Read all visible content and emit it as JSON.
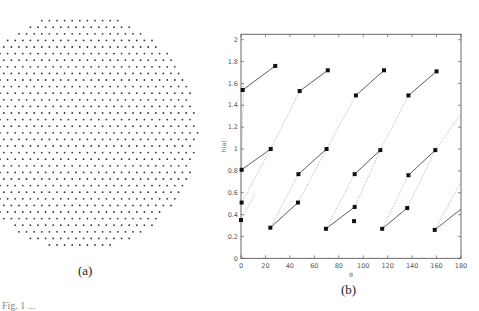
{
  "panels": {
    "a": {
      "caption": "(a)",
      "description": "hexagonal point lattice in circular region"
    },
    "b": {
      "caption": "(b)"
    }
  },
  "footer_cutoff_text": "Fig. 1 ...",
  "chart_data": {
    "type": "scatter",
    "title": "",
    "xlabel": "θ",
    "ylabel": "h(a)",
    "xlim": [
      0,
      180
    ],
    "ylim": [
      0,
      2.05
    ],
    "xticks": [
      0,
      20,
      40,
      60,
      80,
      100,
      120,
      140,
      160,
      180
    ],
    "yticks": [
      0,
      0.2,
      0.4,
      0.6,
      0.8,
      1,
      1.2,
      1.4,
      1.6,
      1.8,
      2
    ],
    "grid": false,
    "markers": [
      [
        0.5,
        0.81
      ],
      [
        24.3,
        1.0
      ],
      [
        0.5,
        0.51
      ],
      [
        0,
        0.35
      ],
      [
        24,
        0.28
      ],
      [
        47,
        0.77
      ],
      [
        46.6,
        0.51
      ],
      [
        70,
        1.0
      ],
      [
        69.5,
        0.27
      ],
      [
        93,
        0.77
      ],
      [
        93,
        0.47
      ],
      [
        92.5,
        0.34
      ],
      [
        114,
        0.99
      ],
      [
        115.5,
        0.27
      ],
      [
        137,
        0.76
      ],
      [
        136,
        0.46
      ],
      [
        159,
        0.99
      ],
      [
        158.5,
        0.26
      ],
      [
        1.4,
        1.54
      ],
      [
        28,
        1.76
      ],
      [
        48,
        1.53
      ],
      [
        71,
        1.72
      ],
      [
        94,
        1.49
      ],
      [
        117,
        1.72
      ],
      [
        137,
        1.49
      ],
      [
        160,
        1.71
      ]
    ],
    "solid_segments": [
      [
        [
          0.5,
          0.81
        ],
        [
          24.3,
          1.0
        ]
      ],
      [
        [
          1.4,
          1.54
        ],
        [
          28,
          1.76
        ]
      ],
      [
        [
          24,
          0.28
        ],
        [
          46.6,
          0.51
        ]
      ],
      [
        [
          47,
          0.77
        ],
        [
          70,
          1.0
        ]
      ],
      [
        [
          48,
          1.53
        ],
        [
          71,
          1.72
        ]
      ],
      [
        [
          69.5,
          0.27
        ],
        [
          93,
          0.47
        ]
      ],
      [
        [
          93,
          0.77
        ],
        [
          114,
          0.99
        ]
      ],
      [
        [
          94,
          1.49
        ],
        [
          117,
          1.72
        ]
      ],
      [
        [
          115.5,
          0.27
        ],
        [
          136,
          0.46
        ]
      ],
      [
        [
          137,
          0.76
        ],
        [
          159,
          0.99
        ]
      ],
      [
        [
          137,
          1.49
        ],
        [
          160,
          1.71
        ]
      ],
      [
        [
          158.5,
          0.26
        ],
        [
          180,
          0.45
        ]
      ]
    ],
    "dotted_segments": [
      [
        [
          0.5,
          0.51
        ],
        [
          24.3,
          1.0
        ]
      ],
      [
        [
          0,
          0.35
        ],
        [
          12,
          0.6
        ]
      ],
      [
        [
          0,
          0.6
        ],
        [
          2,
          1.6
        ]
      ],
      [
        [
          24.3,
          1.0
        ],
        [
          48,
          1.53
        ]
      ],
      [
        [
          24,
          0.28
        ],
        [
          47,
          0.77
        ]
      ],
      [
        [
          46.6,
          0.51
        ],
        [
          70,
          1.0
        ]
      ],
      [
        [
          70,
          1.0
        ],
        [
          94,
          1.49
        ]
      ],
      [
        [
          69.5,
          0.27
        ],
        [
          93,
          0.77
        ]
      ],
      [
        [
          93,
          0.47
        ],
        [
          114,
          0.99
        ]
      ],
      [
        [
          114,
          0.99
        ],
        [
          137,
          1.49
        ]
      ],
      [
        [
          115.5,
          0.27
        ],
        [
          137,
          0.76
        ]
      ],
      [
        [
          136,
          0.46
        ],
        [
          159,
          0.99
        ]
      ],
      [
        [
          159,
          0.99
        ],
        [
          180,
          1.32
        ]
      ],
      [
        [
          158.5,
          0.26
        ],
        [
          180,
          0.7
        ]
      ]
    ]
  }
}
